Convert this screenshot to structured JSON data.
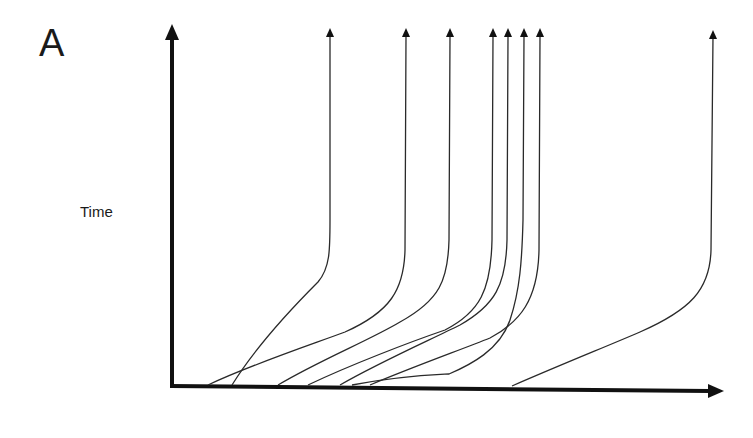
{
  "figure": {
    "panel_label": "A",
    "y_axis_label": "Time",
    "x_axis_label": "",
    "line_color": "#2a2a2a",
    "axis_color": "#111111",
    "background": "#ffffff"
  },
  "axes": {
    "origin": [
      172,
      386
    ],
    "y_axis_top": [
      172,
      28
    ],
    "x_axis_end": [
      722,
      392
    ]
  },
  "trajectories": [
    {
      "id": 1,
      "top_x": 330,
      "start_x": 232,
      "path": "M232,385 C260,340 300,300 318,282 C330,268 330,250 330,220 L330,36"
    },
    {
      "id": 2,
      "top_x": 406,
      "start_x": 208,
      "path": "M208,385 C250,365 310,345 345,332 C390,312 404,290 405,250 L406,36"
    },
    {
      "id": 3,
      "top_x": 450,
      "start_x": 278,
      "path": "M278,385 C320,360 370,340 400,322 C440,300 448,280 449,240 L450,36"
    },
    {
      "id": 4,
      "top_x": 493,
      "start_x": 308,
      "path": "M308,385 C350,365 410,342 445,330 C480,312 491,290 492,240 L493,36"
    },
    {
      "id": 5,
      "top_x": 508,
      "start_x": 340,
      "path": "M340,385 C380,362 430,340 460,325 C495,305 506,285 507,240 L508,36"
    },
    {
      "id": 6,
      "top_x": 524,
      "start_x": 352,
      "path": "M352,385 C400,376 430,375 449,374 C470,365 500,350 510,320 C520,290 522,260 523,220 L524,36"
    },
    {
      "id": 7,
      "top_x": 540,
      "start_x": 370,
      "path": "M370,385 C410,368 460,350 490,338 C520,322 538,300 539,250 L540,36"
    },
    {
      "id": 8,
      "top_x": 713,
      "start_x": 512,
      "path": "M512,386 C560,365 610,345 640,332 C690,310 710,290 711,250 L713,36"
    }
  ]
}
